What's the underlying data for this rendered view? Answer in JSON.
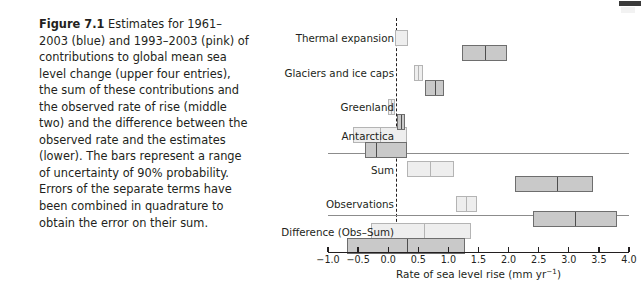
{
  "caption": {
    "label": "Figure 7.1",
    "text": " Estimates for 1961–2003 (blue) and 1993–2003 (pink) of contributions to global mean sea level change (upper four entries), the sum of these contributions and the observed rate of rise (middle two) and the difference between the observed rate and the estimates (lower). The bars represent a range of uncertainty of 90% probability. Errors of the separate terms have been combined in quadrature to obtain the error on their sum."
  },
  "chart_data": {
    "type": "bar",
    "orientation": "horizontal",
    "title": "",
    "xlabel": "Rate of sea level rise (mm yr⁻¹)",
    "ylabel": "",
    "xlim": [
      -1.0,
      4.0
    ],
    "xticks": [
      -1.0,
      -0.5,
      0.0,
      0.5,
      1.0,
      1.5,
      2.0,
      2.5,
      3.0,
      3.5,
      4.0
    ],
    "xticklabels": [
      "−1.0",
      "−0.5",
      "0.0",
      "0.5",
      "1.0",
      "1.5",
      "2.0",
      "2.5",
      "3.0",
      "3.5",
      "4.0"
    ],
    "grid": false,
    "zero_reference_line": 0.0,
    "legend": [
      {
        "name": "1961–2003",
        "color_name": "blue",
        "fill": "#eeeeee",
        "stroke": "#b4b4b4"
      },
      {
        "name": "1993–2003",
        "color_name": "pink",
        "fill": "#c9c9c9",
        "stroke": "#6e6e6e"
      }
    ],
    "categories": [
      "Thermal expansion",
      "Glaciers and ice caps",
      "Greenland",
      "Antarctica",
      "Sum",
      "Observations",
      "Difference (Obs–Sum)"
    ],
    "group_separators_after": [
      "Antarctica",
      "Observations"
    ],
    "series": [
      {
        "name": "1961–2003",
        "color_name": "blue",
        "ranges": [
          {
            "category": "Thermal expansion",
            "low": 0.11,
            "center": 0.42,
            "high": 0.33
          },
          {
            "category": "Glaciers and ice caps",
            "low": 0.43,
            "center": 0.5,
            "high": 0.57
          },
          {
            "category": "Greenland",
            "low": -0.01,
            "center": 0.05,
            "high": 0.11
          },
          {
            "category": "Antarctica",
            "low": -0.59,
            "center": -0.14,
            "high": 0.31
          },
          {
            "category": "Sum",
            "low": 0.31,
            "center": 0.7,
            "high": 1.09
          },
          {
            "category": "Observations",
            "low": 1.12,
            "center": 1.3,
            "high": 1.48
          },
          {
            "category": "Difference (Obs–Sum)",
            "low": -0.29,
            "center": 0.59,
            "high": 1.37
          }
        ]
      },
      {
        "name": "1993–2003",
        "color_name": "pink",
        "ranges": [
          {
            "category": "Thermal expansion",
            "low": 1.23,
            "center": 1.6,
            "high": 1.97
          },
          {
            "category": "Glaciers and ice caps",
            "low": 0.61,
            "center": 0.77,
            "high": 0.93
          },
          {
            "category": "Greenland",
            "low": 0.14,
            "center": 0.21,
            "high": 0.28
          },
          {
            "category": "Antarctica",
            "low": -0.38,
            "center": -0.21,
            "high": 0.31
          },
          {
            "category": "Sum",
            "low": 2.1,
            "center": 2.8,
            "high": 3.4
          },
          {
            "category": "Observations",
            "low": 2.4,
            "center": 3.1,
            "high": 3.8
          },
          {
            "category": "Difference (Obs–Sum)",
            "low": -0.68,
            "center": 0.32,
            "high": 1.28
          }
        ]
      }
    ]
  }
}
